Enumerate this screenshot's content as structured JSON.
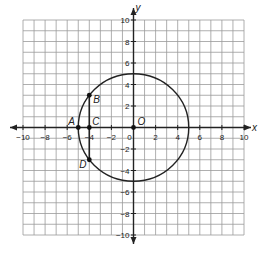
{
  "diagram": {
    "type": "coordinate-plane",
    "x_range": [
      -10,
      10
    ],
    "y_range": [
      -10,
      10
    ],
    "axis_labels": {
      "x": "x",
      "y": "y"
    },
    "x_ticks": [
      "-10",
      "-8",
      "-6",
      "-4",
      "-2",
      "0",
      "2",
      "4",
      "6",
      "8",
      "10"
    ],
    "y_ticks": [
      "10",
      "8",
      "6",
      "4",
      "2",
      "-2",
      "-4",
      "-6",
      "-8",
      "-10"
    ],
    "circle": {
      "center": [
        0,
        0
      ],
      "radius": 5
    },
    "points": [
      {
        "label": "A",
        "x": -5,
        "y": 0
      },
      {
        "label": "B",
        "x": -4,
        "y": 3
      },
      {
        "label": "C",
        "x": -4,
        "y": 0
      },
      {
        "label": "D",
        "x": -4,
        "y": -3
      },
      {
        "label": "O",
        "x": 0,
        "y": 0
      }
    ],
    "segments": [
      [
        "B",
        "D"
      ]
    ]
  }
}
